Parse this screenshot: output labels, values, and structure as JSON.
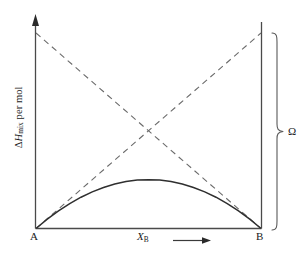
{
  "figure": {
    "background_color": "#ffffff",
    "ink_color": "#3a3a3a",
    "text_color": "#1a1a1a"
  },
  "labels": {
    "y_axis_delta": "Δ",
    "y_axis_h": "H",
    "y_axis_sub": "mix",
    "y_axis_tail": " per mol",
    "y_axis_full": "ΔHmix per mol",
    "x_axis_symbol": "X",
    "x_axis_sub": "B",
    "x_axis_full": "XB",
    "corner_left": "A",
    "corner_right": "B",
    "brace_label": "Ω"
  },
  "chart_data": {
    "type": "line",
    "title": "",
    "xlabel": "XB",
    "ylabel": "ΔHmix per mol",
    "xlim": [
      0,
      1
    ],
    "ylim": [
      0,
      1
    ],
    "grid": false,
    "legend": false,
    "x_tick_labels": [
      "A",
      "B"
    ],
    "x_tick_values": [
      0,
      1
    ],
    "annotations": [
      {
        "text": "Ω",
        "position": "right-brace",
        "span_y": [
          0,
          1
        ]
      },
      {
        "text": "arrow",
        "position": "x-axis-right-of-label",
        "meaning": "increasing XB"
      }
    ],
    "series": [
      {
        "name": "ΔHmix = Ω XA XB",
        "style": "solid",
        "color": "#3a3a3a",
        "x": [
          0.0,
          0.05,
          0.1,
          0.15,
          0.2,
          0.25,
          0.3,
          0.35,
          0.4,
          0.45,
          0.5,
          0.55,
          0.6,
          0.65,
          0.7,
          0.75,
          0.8,
          0.85,
          0.9,
          0.95,
          1.0
        ],
        "values": [
          0.0,
          0.0475,
          0.09,
          0.1275,
          0.16,
          0.1875,
          0.21,
          0.2275,
          0.24,
          0.2475,
          0.25,
          0.2475,
          0.24,
          0.2275,
          0.21,
          0.1875,
          0.16,
          0.1275,
          0.09,
          0.0475,
          0.0
        ]
      },
      {
        "name": "Ω XB (partial, rising)",
        "style": "dashed",
        "color": "#6a6a6a",
        "x": [
          0,
          1
        ],
        "values": [
          0,
          1
        ]
      },
      {
        "name": "Ω XA (partial, falling)",
        "style": "dashed",
        "color": "#6a6a6a",
        "x": [
          0,
          1
        ],
        "values": [
          1,
          0
        ]
      }
    ],
    "intersection": {
      "x": 0.5,
      "y": 0.5
    }
  }
}
